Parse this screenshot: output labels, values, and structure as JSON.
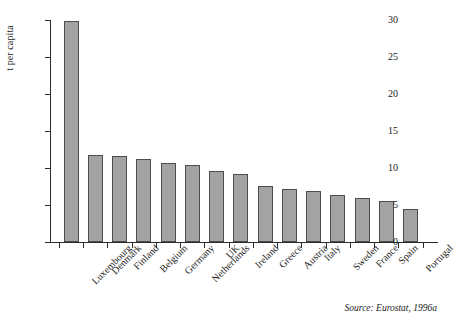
{
  "figure": {
    "ylabel": "t per capita",
    "source": "Source: Eurostat, 1996a",
    "bar_fill": "#a3a3a3",
    "bar_stroke": "#4d4d4d",
    "axis_color": "#2b2b2b"
  },
  "chart_data": {
    "type": "bar",
    "title": "",
    "xlabel": "",
    "ylabel": "t per capita",
    "ylim": [
      0,
      30
    ],
    "yticks": [
      0,
      5,
      10,
      15,
      20,
      25,
      30
    ],
    "grid": false,
    "legend": null,
    "annotations": [
      "Source: Eurostat, 1996a"
    ],
    "categories": [
      "Luxembourg",
      "Denmark",
      "Finland",
      "Belgium",
      "Germany",
      "Netherlands",
      "UK",
      "Ireland",
      "Greece",
      "Austria",
      "Italy",
      "Sweden",
      "France",
      "Spain",
      "Portugal"
    ],
    "values": [
      29.8,
      11.8,
      11.6,
      11.2,
      10.7,
      10.4,
      9.6,
      9.2,
      7.6,
      7.1,
      6.9,
      6.3,
      5.9,
      5.6,
      4.4
    ]
  }
}
